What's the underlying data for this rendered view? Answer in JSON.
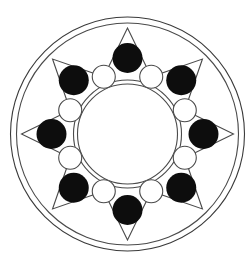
{
  "artwork": {
    "title": "Eight-Pointed Star Mandala",
    "kind": "geometric-line-drawing",
    "background_color": "#ffffff",
    "stroke_color": "#4a4a4a",
    "fill_dark_color": "#0d0d0d",
    "fill_light_color": "#ffffff",
    "canvas": {
      "width": 252,
      "height": 261
    },
    "center": {
      "x": 127.5,
      "y": 134
    }
  },
  "rings": {
    "outer": {
      "name": "outer-ring",
      "radius": 117
    },
    "outer_second": {
      "name": "outer-ring-inner",
      "radius": 111
    },
    "core_outer": {
      "name": "core-ring-outer",
      "radius": 54
    },
    "core_inner": {
      "name": "core-ring-inner",
      "radius": 50
    }
  },
  "star": {
    "name": "eight-pointed-star",
    "points": 8,
    "outer_radius": 106,
    "inner_radius": 62,
    "start_angle_deg": -90
  },
  "dark_dots": {
    "name": "dark-dot-ring",
    "count": 8,
    "radius": 15,
    "orbit_radius": 76,
    "start_angle_deg": -90
  },
  "light_dots": {
    "name": "light-dot-ring",
    "count": 8,
    "radius": 11.5,
    "orbit_radius": 62,
    "start_angle_deg": -67.5
  }
}
